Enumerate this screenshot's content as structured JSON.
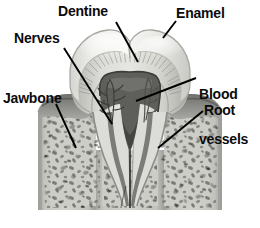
{
  "figure": {
    "background_color": "#ffffff"
  },
  "labels": {
    "dentine": "Dentine",
    "enamel": "Enamel",
    "nerves": "Nerves",
    "blood_vessels_line1": "Blood",
    "blood_vessels_line2": "vessels",
    "jawbone": "Jawbone",
    "root": "Root"
  },
  "colors": {
    "label_text": "#0b0b0b",
    "leader_line": "#000000",
    "enamel": "#e8e8e6",
    "dentine": "#cfcfcb",
    "pulp": "#5a5a58",
    "gingiva": "#8f8f8c",
    "bone": "#bdbdb8",
    "bone_speckle": "#6e6e6a",
    "background": "#ffffff"
  },
  "structures": [
    {
      "name": "enamel",
      "description": "outer white cap of the crown"
    },
    {
      "name": "dentine",
      "description": "striated layer beneath enamel"
    },
    {
      "name": "pulp-chamber",
      "description": "dark central cavity holding nerves and blood vessels"
    },
    {
      "name": "nerves",
      "description": "fine branching strands inside the pulp chamber"
    },
    {
      "name": "blood-vessels",
      "description": "vessels entering the pulp from the root canals"
    },
    {
      "name": "root",
      "description": "two tapering roots embedded in bone"
    },
    {
      "name": "jawbone",
      "description": "speckled spongy bone surrounding the roots"
    },
    {
      "name": "gingiva",
      "description": "dark gum tissue collar at the neck of the tooth"
    }
  ],
  "leader_lines": [
    {
      "name": "dentine-leader",
      "from": [
        116,
        22
      ],
      "to": [
        138,
        62
      ]
    },
    {
      "name": "enamel-leader",
      "from": [
        175,
        22
      ],
      "to": [
        163,
        38
      ]
    },
    {
      "name": "nerves-leader",
      "from": [
        64,
        48
      ],
      "to": [
        112,
        124
      ]
    },
    {
      "name": "blood-vessels-leader",
      "from": [
        196,
        78
      ],
      "to": [
        136,
        101
      ]
    },
    {
      "name": "jawbone-leader",
      "from": [
        55,
        104
      ],
      "to": [
        75,
        148
      ]
    },
    {
      "name": "root-leader",
      "from": [
        203,
        111
      ],
      "to": [
        158,
        148
      ]
    }
  ]
}
